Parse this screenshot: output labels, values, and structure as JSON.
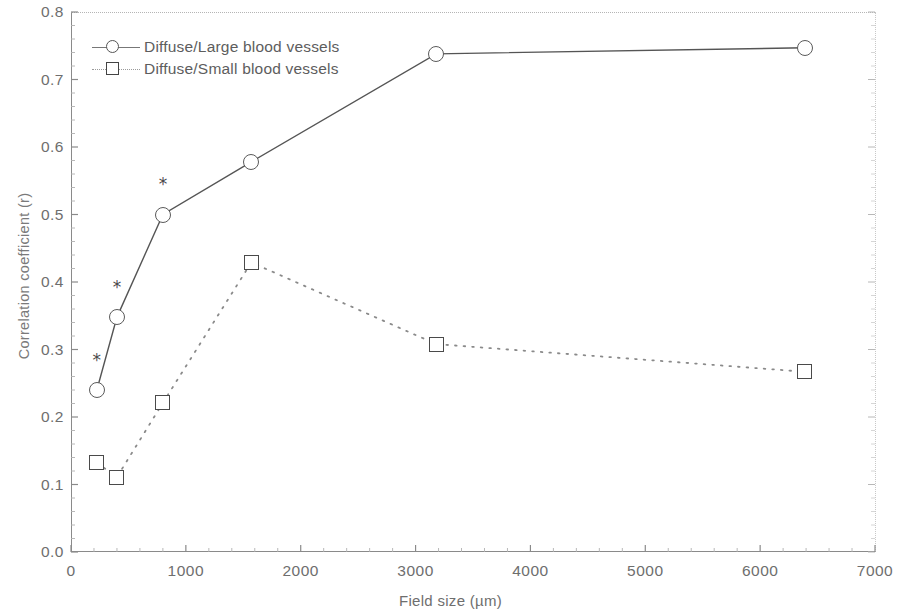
{
  "chart_data": {
    "type": "line",
    "title": "",
    "xlabel": "Field size (µm)",
    "ylabel": "Correlation coefficient (r)",
    "xlim": [
      0,
      7000
    ],
    "ylim": [
      0.0,
      0.8
    ],
    "xticks": [
      0,
      1000,
      2000,
      3000,
      4000,
      5000,
      6000,
      7000
    ],
    "xticklabels": [
      "0",
      "1000",
      "2000",
      "3000",
      "4000",
      "5000",
      "6000",
      "7000"
    ],
    "yticks": [
      0.0,
      0.1,
      0.2,
      0.3,
      0.4,
      0.5,
      0.6,
      0.7,
      0.8
    ],
    "yticklabels": [
      "0.0",
      "0.1",
      "0.2",
      "0.3",
      "0.4",
      "0.5",
      "0.6",
      "0.7",
      "0.8"
    ],
    "grid": false,
    "legend_position": "upper left",
    "series": [
      {
        "name": "Diffuse/Large blood vessels",
        "marker": "circle",
        "linestyle": "solid",
        "color": "#555555",
        "x": [
          225,
          400,
          800,
          1570,
          3180,
          6390
        ],
        "y": [
          0.24,
          0.348,
          0.5,
          0.578,
          0.738,
          0.747
        ]
      },
      {
        "name": "Diffuse/Small blood vessels",
        "marker": "square",
        "linestyle": "dotted",
        "color": "#8a8a8a",
        "x": [
          225,
          400,
          800,
          1570,
          3180,
          6390
        ],
        "y": [
          0.132,
          0.111,
          0.221,
          0.429,
          0.308,
          0.267
        ]
      }
    ],
    "annotations": [
      {
        "text": "*",
        "x": 225,
        "y": 0.285,
        "note": "significance marker above Diffuse/Large point at 225 µm"
      },
      {
        "text": "*",
        "x": 400,
        "y": 0.393,
        "note": "significance marker above Diffuse/Large point at 400 µm"
      },
      {
        "text": "*",
        "x": 800,
        "y": 0.545,
        "note": "significance marker above Diffuse/Large point at 800 µm"
      }
    ]
  },
  "axes": {
    "xlabel": "Field size (µm)",
    "ylabel": "Correlation coefficient (r)"
  },
  "legend": {
    "items": [
      {
        "label": "Diffuse/Large blood vessels",
        "marker": "circle"
      },
      {
        "label": "Diffuse/Small blood vessels",
        "marker": "square"
      }
    ]
  }
}
